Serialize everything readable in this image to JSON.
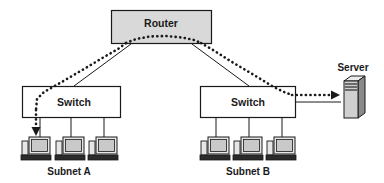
{
  "diagram": {
    "colors": {
      "stroke": "#1a1a1a",
      "box_fill": "#d9d9d9",
      "switch_fill": "#ffffff",
      "monitor_screen": "#c9c9c9",
      "monitor_body": "#e6e6e6",
      "server_front": "#d0d0d0",
      "server_side": "#8a8a8a",
      "server_top": "#ededed",
      "base_dark": "#2b2b2b",
      "background": "#ffffff"
    },
    "nodes": {
      "router": {
        "label": "Router",
        "x": 111,
        "y": 10,
        "width": 101,
        "height": 34
      },
      "switch_a": {
        "label": "Switch",
        "x": 22,
        "y": 86,
        "width": 99,
        "height": 32
      },
      "switch_b": {
        "label": "Switch",
        "x": 200,
        "y": 86,
        "width": 96,
        "height": 32
      },
      "server": {
        "label": "Server",
        "x": 340,
        "y": 77,
        "width": 22,
        "height": 40
      }
    },
    "subnets": [
      {
        "id": "subnet-a",
        "label": "Subnet A",
        "x": 72,
        "y": 172
      },
      {
        "id": "subnet-b",
        "label": "Subnet B",
        "x": 250,
        "y": 172
      }
    ],
    "workstations": [
      {
        "id": "pc-a1",
        "subnet": "subnet-a",
        "x": 22,
        "y": 134,
        "highlighted": true
      },
      {
        "id": "pc-a2",
        "subnet": "subnet-a",
        "x": 58,
        "y": 134,
        "highlighted": false
      },
      {
        "id": "pc-a3",
        "subnet": "subnet-a",
        "x": 92,
        "y": 134,
        "highlighted": false
      },
      {
        "id": "pc-b1",
        "subnet": "subnet-b",
        "x": 202,
        "y": 134,
        "highlighted": false
      },
      {
        "id": "pc-b2",
        "subnet": "subnet-b",
        "x": 236,
        "y": 134,
        "highlighted": false
      },
      {
        "id": "pc-b3",
        "subnet": "subnet-b",
        "x": 270,
        "y": 134,
        "highlighted": false
      }
    ],
    "links": {
      "solid": [
        {
          "id": "router-to-switch-a",
          "from": "router",
          "to": "switch_a",
          "points": "130,44 74,86"
        },
        {
          "id": "router-to-switch-b",
          "from": "router",
          "to": "switch_b",
          "points": "193,44 248,86"
        },
        {
          "id": "switch-a-drop-1",
          "points": "40,118 40,136"
        },
        {
          "id": "switch-a-drop-2",
          "points": "71,118 71,136"
        },
        {
          "id": "switch-a-drop-3",
          "points": "104,118 104,136"
        },
        {
          "id": "switch-b-drop-1",
          "points": "216,118 216,136"
        },
        {
          "id": "switch-b-drop-2",
          "points": "249,118 249,136"
        },
        {
          "id": "switch-b-drop-3",
          "points": "282,118 282,136"
        },
        {
          "id": "switch-b-to-server",
          "points": "296,102 340,102"
        }
      ],
      "dotted_path": {
        "id": "traffic-path",
        "description": "Dotted traffic flow: PC in Subnet A up through Switch A, across Router, down to Switch B and out to Server",
        "segments": [
          "34,140 34,89",
          "34,89 124,42",
          "124,42 200,42",
          "200,42 290,89",
          "290,89 336,89"
        ],
        "arrows": [
          "pc-a1-down",
          "server-in"
        ]
      }
    }
  }
}
